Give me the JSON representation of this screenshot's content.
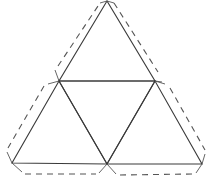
{
  "diagram": {
    "colors": {
      "fold_line": "#3a3a3a",
      "tab_line": "#555555",
      "background": "#ffffff"
    },
    "vertices": {
      "top": [
        107,
        1
      ],
      "mid_left": [
        59,
        81
      ],
      "mid_right": [
        155,
        81
      ],
      "bottom_left": [
        12,
        163
      ],
      "bottom_mid": [
        107,
        164
      ],
      "bottom_right": [
        202,
        164
      ]
    },
    "faces": [
      {
        "name": "top-face",
        "points": "107,1 59,81 155,81"
      },
      {
        "name": "center-face",
        "points": "59,81 155,81 107,164"
      },
      {
        "name": "left-face",
        "points": "59,81 12,163 107,164"
      },
      {
        "name": "right-face",
        "points": "155,81 107,164 202,164"
      }
    ],
    "tabs": [
      {
        "name": "tab-top-left",
        "dash": "58,66 100,3",
        "ends": [
          "59,81 55,70",
          "107,1 100,3"
        ]
      },
      {
        "name": "tab-top-right",
        "dash": "114,3 158,72",
        "ends": [
          "107,1 114,3",
          "155,81 162,82"
        ]
      },
      {
        "name": "tab-lower-left",
        "dash": "44,86 8,148",
        "ends": [
          "59,81 48,84",
          "12,163 7,152"
        ]
      },
      {
        "name": "tab-lower-right",
        "dash": "170,88 205,150",
        "ends": [
          "155,81 165,84",
          "202,164 205,154"
        ]
      },
      {
        "name": "tab-bottom-left",
        "dash": "25,174 96,174",
        "ends": [
          "12,163 22,172",
          "107,164 99,173"
        ]
      },
      {
        "name": "tab-bottom-right",
        "dash": "120,175 192,174",
        "ends": [
          "107,164 116,174",
          "202,164 196,173"
        ]
      }
    ]
  }
}
